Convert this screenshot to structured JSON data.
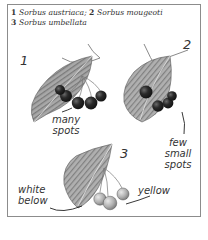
{
  "caption": {
    "line1": [
      {
        "num": "1",
        "name": "Sorbus austriaca;"
      },
      {
        "num": "2",
        "name": "Sorbus mougeoti"
      }
    ],
    "line2": [
      {
        "num": "3",
        "name": "Sorbus umbellata"
      }
    ]
  },
  "figures": [
    {
      "number": "1",
      "species": "Sorbus austriaca",
      "labels": [
        "many",
        "spots"
      ]
    },
    {
      "number": "2",
      "species": "Sorbus mougeoti",
      "labels": [
        "few",
        "small",
        "spots"
      ]
    },
    {
      "number": "3",
      "species": "Sorbus umbellata",
      "labels_left": [
        "white",
        "below"
      ],
      "labels_right": [
        "yellow"
      ]
    }
  ],
  "colors": {
    "frame": "#8c8c8c",
    "ink": "#333333",
    "leaf": "#9a9a9a",
    "leaf_dark": "#6e6e6e",
    "berry_dark": "#1e1e1e",
    "berry_light": "#b4b4b4"
  }
}
